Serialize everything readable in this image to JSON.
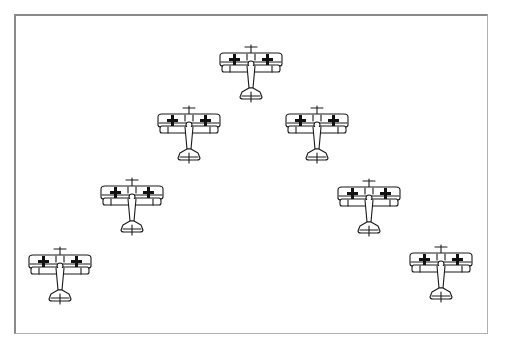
{
  "illustration": {
    "subject": "biplane formation",
    "frame": {
      "border_color": "#8a8a8a",
      "background": "#ffffff"
    },
    "line_color": "#1a1a1a",
    "cross_color": "#111111",
    "planes": [
      {
        "id": "lead",
        "x": 216,
        "y": 44
      },
      {
        "id": "left-1",
        "x": 154,
        "y": 105
      },
      {
        "id": "right-1",
        "x": 282,
        "y": 105
      },
      {
        "id": "left-2",
        "x": 97,
        "y": 177
      },
      {
        "id": "right-2",
        "x": 334,
        "y": 178
      },
      {
        "id": "left-3",
        "x": 25,
        "y": 246
      },
      {
        "id": "right-3",
        "x": 406,
        "y": 244
      }
    ]
  }
}
